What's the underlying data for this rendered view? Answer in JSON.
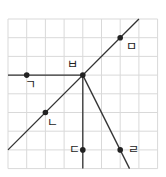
{
  "diagram": {
    "grid": {
      "x0": 8,
      "y0": 19,
      "cols": 8,
      "rows": 8,
      "cell": 18.7,
      "color": "#d9d9d9"
    },
    "line_color": "#333333",
    "points": [
      {
        "id": "giyeok",
        "label": "ㄱ",
        "gx": 1,
        "gy": 3,
        "lx": -2,
        "ly": 14
      },
      {
        "id": "nieun",
        "label": "ㄴ",
        "gx": 2,
        "gy": 5,
        "lx": 2,
        "ly": 14
      },
      {
        "id": "digeut",
        "label": "ㄷ",
        "gx": 4,
        "gy": 7,
        "lx": -14,
        "ly": 4
      },
      {
        "id": "rieul",
        "label": "ㄹ",
        "gx": 6,
        "gy": 7,
        "lx": 8,
        "ly": 4
      },
      {
        "id": "mieum",
        "label": "ㅁ",
        "gx": 6,
        "gy": 1,
        "lx": 6,
        "ly": 13
      },
      {
        "id": "bieup",
        "label": "ㅂ",
        "gx": 4,
        "gy": 3,
        "lx": -16,
        "ly": -6
      }
    ],
    "lines": [
      {
        "id": "horizontal-ray",
        "x1": 0,
        "y1": 3,
        "x2": 4,
        "y2": 3
      },
      {
        "id": "diagonal-line",
        "x1": 0,
        "y1": 7,
        "x2": 7,
        "y2": 0
      },
      {
        "id": "vertical-ray",
        "x1": 4,
        "y1": 3,
        "x2": 4,
        "y2": 8
      },
      {
        "id": "steep-ray",
        "x1": 4,
        "y1": 3,
        "x2": 6.5,
        "y2": 8
      }
    ]
  }
}
